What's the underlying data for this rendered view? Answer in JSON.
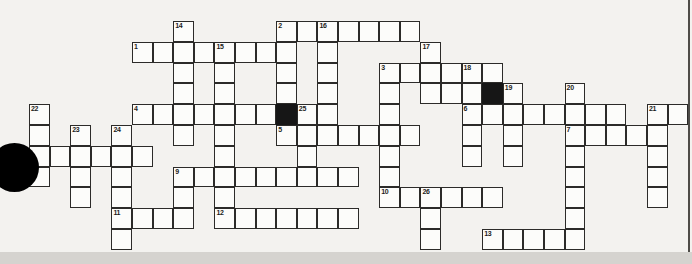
{
  "page": {
    "background_color": "#f3f2ef",
    "cell_color": "#fcfcfa",
    "line_color": "#2c2b29",
    "black_cell_color": "#161616",
    "bottom_band_color": "#d5d3cf",
    "edge_line_color": "#4e4c48"
  },
  "grid": {
    "origin_x": 29,
    "origin_y": 21,
    "cell_w": 20.6,
    "cell_h": 20.8,
    "cols": 32,
    "rows": 11
  },
  "puzzle": {
    "type": "free-form crossword grid",
    "black_cells": [
      [
        22,
        3
      ],
      [
        12,
        4
      ]
    ],
    "numbers": {
      "1": [
        5,
        1
      ],
      "2": [
        12,
        0
      ],
      "3": [
        17,
        2
      ],
      "4": [
        5,
        4
      ],
      "5": [
        12,
        5
      ],
      "6": [
        21,
        4
      ],
      "7": [
        26,
        5
      ],
      "8": [
        0,
        6
      ],
      "9": [
        7,
        7
      ],
      "10": [
        17,
        8
      ],
      "11": [
        4,
        9
      ],
      "12": [
        9,
        9
      ],
      "13": [
        22,
        10
      ],
      "14": [
        7,
        0
      ],
      "15": [
        9,
        1
      ],
      "16": [
        14,
        0
      ],
      "17": [
        19,
        1
      ],
      "18": [
        21,
        2
      ],
      "19": [
        23,
        3
      ],
      "20": [
        26,
        3
      ],
      "21": [
        30,
        4
      ],
      "22": [
        0,
        4
      ],
      "23": [
        2,
        5
      ],
      "24": [
        4,
        5
      ],
      "25": [
        13,
        4
      ],
      "26": [
        19,
        8
      ]
    },
    "cells": [
      {
        "c": 7,
        "r": 0,
        "n": "14"
      },
      {
        "c": 12,
        "r": 0,
        "n": "2"
      },
      {
        "c": 13,
        "r": 0
      },
      {
        "c": 14,
        "r": 0,
        "n": "16"
      },
      {
        "c": 15,
        "r": 0
      },
      {
        "c": 16,
        "r": 0
      },
      {
        "c": 17,
        "r": 0
      },
      {
        "c": 18,
        "r": 0
      },
      {
        "c": 5,
        "r": 1,
        "n": "1"
      },
      {
        "c": 6,
        "r": 1
      },
      {
        "c": 7,
        "r": 1
      },
      {
        "c": 8,
        "r": 1
      },
      {
        "c": 9,
        "r": 1,
        "n": "15"
      },
      {
        "c": 10,
        "r": 1
      },
      {
        "c": 11,
        "r": 1
      },
      {
        "c": 12,
        "r": 1
      },
      {
        "c": 14,
        "r": 1
      },
      {
        "c": 19,
        "r": 1,
        "n": "17"
      },
      {
        "c": 7,
        "r": 2
      },
      {
        "c": 9,
        "r": 2
      },
      {
        "c": 12,
        "r": 2
      },
      {
        "c": 14,
        "r": 2
      },
      {
        "c": 17,
        "r": 2,
        "n": "3"
      },
      {
        "c": 18,
        "r": 2
      },
      {
        "c": 19,
        "r": 2
      },
      {
        "c": 20,
        "r": 2
      },
      {
        "c": 21,
        "r": 2,
        "n": "18"
      },
      {
        "c": 22,
        "r": 2
      },
      {
        "c": 7,
        "r": 3
      },
      {
        "c": 9,
        "r": 3
      },
      {
        "c": 12,
        "r": 3
      },
      {
        "c": 14,
        "r": 3
      },
      {
        "c": 17,
        "r": 3
      },
      {
        "c": 19,
        "r": 3
      },
      {
        "c": 20,
        "r": 3
      },
      {
        "c": 21,
        "r": 3
      },
      {
        "c": 22,
        "r": 3,
        "b": 1
      },
      {
        "c": 23,
        "r": 3,
        "n": "19"
      },
      {
        "c": 26,
        "r": 3,
        "n": "20"
      },
      {
        "c": 0,
        "r": 4,
        "n": "22"
      },
      {
        "c": 5,
        "r": 4,
        "n": "4"
      },
      {
        "c": 6,
        "r": 4
      },
      {
        "c": 7,
        "r": 4
      },
      {
        "c": 8,
        "r": 4
      },
      {
        "c": 9,
        "r": 4
      },
      {
        "c": 10,
        "r": 4
      },
      {
        "c": 11,
        "r": 4
      },
      {
        "c": 12,
        "r": 4,
        "b": 1
      },
      {
        "c": 13,
        "r": 4,
        "n": "25"
      },
      {
        "c": 14,
        "r": 4
      },
      {
        "c": 17,
        "r": 4
      },
      {
        "c": 21,
        "r": 4,
        "n": "6"
      },
      {
        "c": 22,
        "r": 4
      },
      {
        "c": 23,
        "r": 4
      },
      {
        "c": 24,
        "r": 4
      },
      {
        "c": 25,
        "r": 4
      },
      {
        "c": 26,
        "r": 4
      },
      {
        "c": 27,
        "r": 4
      },
      {
        "c": 28,
        "r": 4
      },
      {
        "c": 30,
        "r": 4,
        "n": "21"
      },
      {
        "c": 31,
        "r": 4
      },
      {
        "c": 0,
        "r": 5
      },
      {
        "c": 2,
        "r": 5,
        "n": "23"
      },
      {
        "c": 4,
        "r": 5,
        "n": "24"
      },
      {
        "c": 7,
        "r": 5
      },
      {
        "c": 9,
        "r": 5
      },
      {
        "c": 12,
        "r": 5,
        "n": "5"
      },
      {
        "c": 13,
        "r": 5
      },
      {
        "c": 14,
        "r": 5
      },
      {
        "c": 15,
        "r": 5
      },
      {
        "c": 16,
        "r": 5
      },
      {
        "c": 17,
        "r": 5
      },
      {
        "c": 18,
        "r": 5
      },
      {
        "c": 21,
        "r": 5
      },
      {
        "c": 23,
        "r": 5
      },
      {
        "c": 26,
        "r": 5,
        "n": "7"
      },
      {
        "c": 27,
        "r": 5
      },
      {
        "c": 28,
        "r": 5
      },
      {
        "c": 29,
        "r": 5
      },
      {
        "c": 30,
        "r": 5
      },
      {
        "c": 0,
        "r": 6
      },
      {
        "c": 1,
        "r": 6
      },
      {
        "c": 2,
        "r": 6
      },
      {
        "c": 3,
        "r": 6
      },
      {
        "c": 4,
        "r": 6
      },
      {
        "c": 5,
        "r": 6
      },
      {
        "c": 9,
        "r": 6
      },
      {
        "c": 13,
        "r": 6
      },
      {
        "c": 17,
        "r": 6
      },
      {
        "c": 21,
        "r": 6
      },
      {
        "c": 23,
        "r": 6
      },
      {
        "c": 26,
        "r": 6
      },
      {
        "c": 30,
        "r": 6
      },
      {
        "c": 0,
        "r": 7
      },
      {
        "c": 2,
        "r": 7
      },
      {
        "c": 4,
        "r": 7
      },
      {
        "c": 7,
        "r": 7,
        "n": "9"
      },
      {
        "c": 8,
        "r": 7
      },
      {
        "c": 9,
        "r": 7
      },
      {
        "c": 10,
        "r": 7
      },
      {
        "c": 11,
        "r": 7
      },
      {
        "c": 12,
        "r": 7
      },
      {
        "c": 13,
        "r": 7
      },
      {
        "c": 14,
        "r": 7
      },
      {
        "c": 15,
        "r": 7
      },
      {
        "c": 17,
        "r": 7
      },
      {
        "c": 26,
        "r": 7
      },
      {
        "c": 30,
        "r": 7
      },
      {
        "c": 2,
        "r": 8
      },
      {
        "c": 4,
        "r": 8
      },
      {
        "c": 7,
        "r": 8
      },
      {
        "c": 9,
        "r": 8
      },
      {
        "c": 17,
        "r": 8,
        "n": "10"
      },
      {
        "c": 18,
        "r": 8
      },
      {
        "c": 19,
        "r": 8,
        "n": "26"
      },
      {
        "c": 20,
        "r": 8
      },
      {
        "c": 21,
        "r": 8
      },
      {
        "c": 22,
        "r": 8
      },
      {
        "c": 26,
        "r": 8
      },
      {
        "c": 30,
        "r": 8
      },
      {
        "c": 4,
        "r": 9,
        "n": "11"
      },
      {
        "c": 5,
        "r": 9
      },
      {
        "c": 6,
        "r": 9
      },
      {
        "c": 7,
        "r": 9
      },
      {
        "c": 9,
        "r": 9,
        "n": "12"
      },
      {
        "c": 10,
        "r": 9
      },
      {
        "c": 11,
        "r": 9
      },
      {
        "c": 12,
        "r": 9
      },
      {
        "c": 13,
        "r": 9
      },
      {
        "c": 14,
        "r": 9
      },
      {
        "c": 15,
        "r": 9
      },
      {
        "c": 19,
        "r": 9
      },
      {
        "c": 26,
        "r": 9
      },
      {
        "c": 4,
        "r": 10
      },
      {
        "c": 19,
        "r": 10
      },
      {
        "c": 22,
        "r": 10,
        "n": "13"
      },
      {
        "c": 23,
        "r": 10
      },
      {
        "c": 24,
        "r": 10
      },
      {
        "c": 25,
        "r": 10
      },
      {
        "c": 26,
        "r": 10
      }
    ]
  },
  "decorations": {
    "hole_punch": {
      "x": -10,
      "y": 143,
      "size": 49
    },
    "right_edge_line": {
      "x": 687.5,
      "y": 0,
      "w": 2.5,
      "h": 253
    },
    "bottom_band": {
      "x": 0,
      "y": 252,
      "w": 692,
      "h": 12
    }
  }
}
